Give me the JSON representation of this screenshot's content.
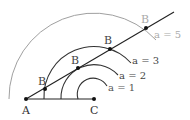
{
  "points": {
    "A": {
      "label": "A",
      "x": 26,
      "y": 99
    },
    "C": {
      "label": "C",
      "x": 94,
      "y": 99
    }
  },
  "line_end": {
    "x": 174,
    "y": 12
  },
  "arcs": [
    {
      "label": "a = 1",
      "radius": 16,
      "color": "#333333",
      "label_color": "#555555",
      "B": null
    },
    {
      "label": "a = 2",
      "radius": 33,
      "color": "#333333",
      "label_color": "#444444",
      "B": {
        "label": "B",
        "x": 78,
        "y": 68
      }
    },
    {
      "label": "a = 3",
      "radius": 50,
      "color": "#333333",
      "label_color": "#444444",
      "B": {
        "label": "B",
        "x": 110,
        "y": 48
      }
    },
    {
      "label": "a = 5",
      "radius": 85,
      "color": "#9a9a9a",
      "label_color": "#aaaaaa",
      "B": {
        "label": "B",
        "x": 146,
        "y": 28
      }
    }
  ],
  "extra_B": {
    "label": "B",
    "x": 45,
    "y": 89
  }
}
